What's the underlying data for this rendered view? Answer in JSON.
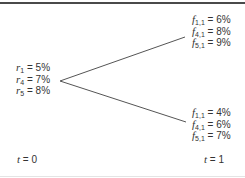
{
  "diagram": {
    "root": {
      "labels": [
        {
          "var": "r",
          "sub": "1",
          "value": "= 5%"
        },
        {
          "var": "r",
          "sub": "4",
          "value": "= 7%"
        },
        {
          "var": "r",
          "sub": "5",
          "value": "= 8%"
        }
      ]
    },
    "up_node": {
      "labels": [
        {
          "var": "f",
          "sub": "1,1",
          "value": "= 6%"
        },
        {
          "var": "f",
          "sub": "4,1",
          "value": "= 8%"
        },
        {
          "var": "f",
          "sub": "5,1",
          "value": "= 9%"
        }
      ]
    },
    "down_node": {
      "labels": [
        {
          "var": "f",
          "sub": "1,1",
          "value": "= 4%"
        },
        {
          "var": "f",
          "sub": "4,1",
          "value": "= 6%"
        },
        {
          "var": "f",
          "sub": "5,1",
          "value": "= 7%"
        }
      ]
    },
    "time_labels": [
      {
        "var": "t",
        "value": "= 0"
      },
      {
        "var": "t",
        "value": "= 1"
      }
    ],
    "colors": {
      "line": "#555555",
      "text": "#333333",
      "top_rule": "#4a4a4a"
    }
  }
}
